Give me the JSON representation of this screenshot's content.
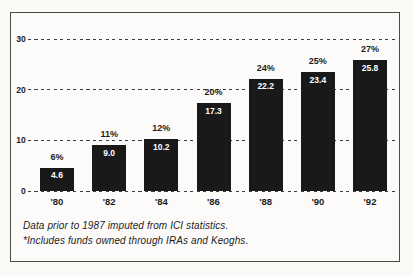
{
  "figure": {
    "footnote_line1": "Data prior to 1987 imputed from ICI statistics.",
    "footnote_line2": "*Includes funds owned through IRAs and Keoghs."
  },
  "chart_data": {
    "type": "bar",
    "title": "",
    "xlabel": "",
    "ylabel": "",
    "categories": [
      "'80",
      "'82",
      "'84",
      "'86",
      "'88",
      "'90",
      "'92"
    ],
    "values": [
      4.6,
      9.0,
      10.2,
      17.3,
      22.2,
      23.4,
      25.8
    ],
    "value_labels": [
      "4.6",
      "9.0",
      "10.2",
      "17.3",
      "22.2",
      "23.4",
      "25.8"
    ],
    "percent_labels": [
      "6%",
      "11%",
      "12%",
      "20%",
      "24%",
      "25%",
      "27%"
    ],
    "ylim": [
      0,
      30
    ],
    "yticks": [
      0,
      10,
      20,
      30
    ],
    "grid": "horizontal-dashed",
    "legend": "none",
    "colors": {
      "bar": "#191919",
      "bar_value_text": "#ffffff",
      "axis_text": "#1c1c1c",
      "gridline": "#3c3c3c",
      "frame_border": "#4a4a4a",
      "background": "#fbfaf7"
    },
    "footnotes": [
      "Data prior to 1987 imputed from ICI statistics.",
      "*Includes funds owned through IRAs and Keoghs."
    ]
  }
}
